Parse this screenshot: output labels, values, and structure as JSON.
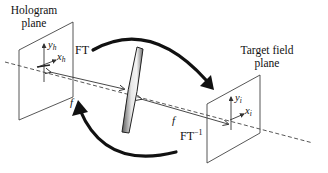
{
  "diagram": {
    "hologram_plane": {
      "title_line1": "Hologram",
      "title_line2": "plane",
      "axis_y": "y",
      "axis_y_sub": "h",
      "axis_x": "x",
      "axis_x_sub": "h"
    },
    "target_plane": {
      "title_line1": "Target field",
      "title_line2": "plane",
      "axis_y": "y",
      "axis_y_sub": "i",
      "axis_x": "x",
      "axis_x_sub": "i"
    },
    "forward_transform": {
      "label": "FT"
    },
    "inverse_transform": {
      "label": "FT",
      "superscript": "−1"
    },
    "focal_length_left": "f",
    "focal_length_right": "f",
    "lens": "lens"
  },
  "colors": {
    "line": "#333333",
    "arrow": "#111111",
    "lens_light": "#f2f2f2",
    "lens_dark": "#5a5a5a"
  }
}
